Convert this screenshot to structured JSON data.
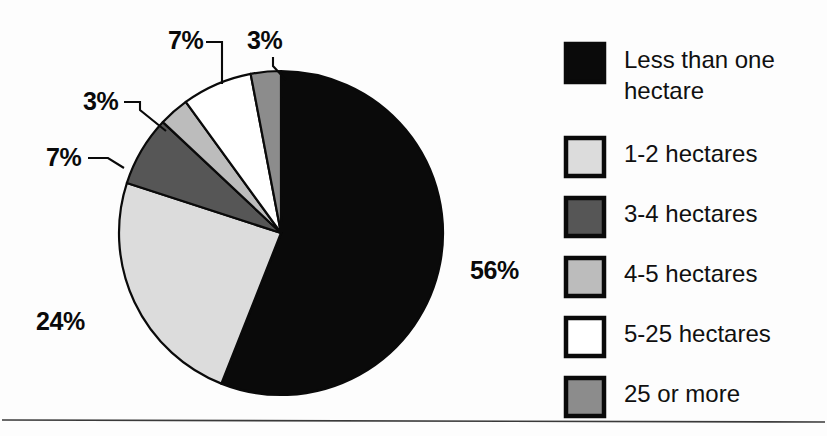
{
  "chart_data": {
    "type": "pie",
    "title": "",
    "subtitle": "",
    "xlabel": "",
    "ylabel": "",
    "units": "percent",
    "legend_position": "right",
    "grid": false,
    "start_angle_deg": 0,
    "direction": "clockwise",
    "categories": [
      "Less than one hectare",
      "1-2 hectares",
      "3-4 hectares",
      "4-5 hectares",
      "5-25 hectares",
      "25 or more"
    ],
    "values": [
      56,
      24,
      7,
      3,
      7,
      3
    ],
    "value_labels": [
      "56%",
      "24%",
      "7%",
      "3%",
      "7%",
      "3%"
    ],
    "colors": [
      "#0a0a0a",
      "#dcdcdc",
      "#565656",
      "#bcbcbc",
      "#ffffff",
      "#8c8c8c"
    ],
    "slices": [
      {
        "label": "Less than one hectare",
        "value": 56,
        "display": "56%",
        "color": "#0a0a0a"
      },
      {
        "label": "1-2 hectares",
        "value": 24,
        "display": "24%",
        "color": "#dcdcdc"
      },
      {
        "label": "3-4 hectares",
        "value": 7,
        "display": "7%",
        "color": "#565656"
      },
      {
        "label": "4-5 hectares",
        "value": 3,
        "display": "3%",
        "color": "#bcbcbc"
      },
      {
        "label": "5-25 hectares",
        "value": 7,
        "display": "7%",
        "color": "#ffffff"
      },
      {
        "label": "25 or more",
        "value": 3,
        "display": "3%",
        "color": "#8c8c8c"
      }
    ]
  },
  "pie": {
    "center_x": 281,
    "center_y": 233,
    "radius": 162,
    "outline_color": "#0a0a0a",
    "callouts": [
      {
        "name": "callout-56",
        "text": "56%",
        "x": 470,
        "y": 279,
        "anchor": "start"
      },
      {
        "name": "callout-24",
        "text": "24%",
        "x": 36,
        "y": 330,
        "anchor": "start"
      },
      {
        "name": "callout-7a",
        "text": "7%",
        "x": 46,
        "y": 166,
        "anchor": "start"
      },
      {
        "name": "callout-3a",
        "text": "3%",
        "x": 83,
        "y": 110,
        "anchor": "start"
      },
      {
        "name": "callout-7b",
        "text": "7%",
        "x": 168,
        "y": 49,
        "anchor": "start"
      },
      {
        "name": "callout-3b",
        "text": "3%",
        "x": 247,
        "y": 49,
        "anchor": "start"
      }
    ]
  },
  "legend": {
    "items": [
      {
        "label": "Less than one\nhectare",
        "line1": "Less than one",
        "line2": "hectare",
        "color": "#0a0a0a"
      },
      {
        "label": "1-2 hectares",
        "line1": "1-2 hectares",
        "line2": "",
        "color": "#dcdcdc"
      },
      {
        "label": "3-4 hectares",
        "line1": "3-4 hectares",
        "line2": "",
        "color": "#565656"
      },
      {
        "label": "4-5 hectares",
        "line1": "4-5 hectares",
        "line2": "",
        "color": "#bcbcbc"
      },
      {
        "label": "5-25 hectares",
        "line1": "5-25 hectares",
        "line2": "",
        "color": "#ffffff"
      },
      {
        "label": "25 or more",
        "line1": "25 or more",
        "line2": "",
        "color": "#8c8c8c"
      }
    ]
  },
  "footer": {
    "rule_color": "#3a3a3a"
  }
}
